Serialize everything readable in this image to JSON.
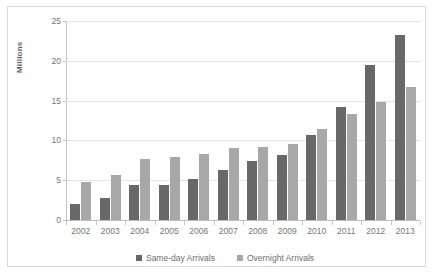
{
  "chart_data": {
    "type": "bar",
    "title": "",
    "subtitle": "",
    "xlabel": "",
    "ylabel": "Millions",
    "ylim": [
      0,
      25
    ],
    "yticks": [
      0,
      5,
      10,
      15,
      20,
      25
    ],
    "grid": true,
    "legend_position": "bottom",
    "categories": [
      "2002",
      "2003",
      "2004",
      "2005",
      "2006",
      "2007",
      "2008",
      "2009",
      "2010",
      "2011",
      "2012",
      "2013"
    ],
    "series": [
      {
        "name": "Same-day Arrivals",
        "color": "#686868",
        "values": [
          2.0,
          2.8,
          4.4,
          4.4,
          5.1,
          6.3,
          7.4,
          8.2,
          10.7,
          14.2,
          19.5,
          23.3
        ]
      },
      {
        "name": "Overnight Arrivals",
        "color": "#a8a8a8",
        "values": [
          4.8,
          5.6,
          7.7,
          7.9,
          8.3,
          9.0,
          9.2,
          9.5,
          11.4,
          13.3,
          14.8,
          16.7
        ]
      }
    ]
  }
}
